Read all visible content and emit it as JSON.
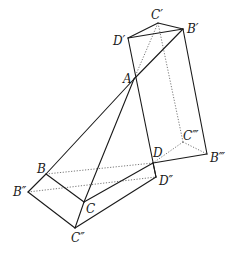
{
  "diagram": {
    "type": "geometric-figure",
    "points": {
      "A": "A",
      "B": "B",
      "C": "C",
      "D": "D",
      "B1": "B′",
      "C1": "C′",
      "D1": "D′",
      "B2": "B″",
      "C2": "C″",
      "D2": "D″",
      "B3": "B‴",
      "C3": "C‴"
    },
    "solid_edges": [
      [
        "D1",
        "C1"
      ],
      [
        "C1",
        "B1"
      ],
      [
        "D1",
        "B1"
      ],
      [
        "B1",
        "A"
      ],
      [
        "A",
        "B"
      ],
      [
        "A",
        "C"
      ],
      [
        "D1",
        "D2"
      ],
      [
        "B1",
        "B3"
      ],
      [
        "B3",
        "D"
      ],
      [
        "B",
        "C"
      ],
      [
        "C",
        "D"
      ],
      [
        "B",
        "B2"
      ],
      [
        "B2",
        "C2"
      ],
      [
        "C2",
        "D2"
      ],
      [
        "C",
        "C2"
      ],
      [
        "D",
        "D2"
      ]
    ],
    "dotted_edges": [
      [
        "C1",
        "A"
      ],
      [
        "C1",
        "C3"
      ],
      [
        "C3",
        "D"
      ],
      [
        "C3",
        "B3"
      ],
      [
        "B",
        "D"
      ],
      [
        "B2",
        "D2"
      ]
    ]
  }
}
